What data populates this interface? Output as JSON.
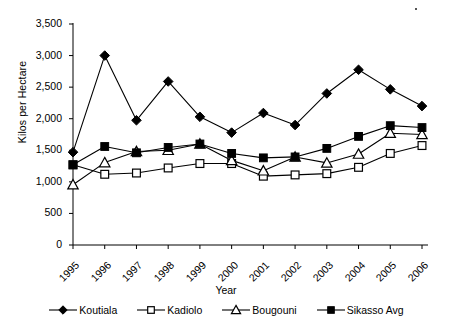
{
  "chart_data": {
    "type": "line",
    "title": "",
    "xlabel": "Year",
    "ylabel": "Kilos per Hectare",
    "categories": [
      "1995",
      "1996",
      "1997",
      "1998",
      "1999",
      "2000",
      "2001",
      "2002",
      "2003",
      "2004",
      "2005",
      "2006"
    ],
    "x": [
      1995,
      1996,
      1997,
      1998,
      1999,
      2000,
      2001,
      2002,
      2003,
      2004,
      2005,
      2006
    ],
    "ylim": [
      0,
      3500
    ],
    "yticks": [
      0,
      500,
      1000,
      1500,
      2000,
      2500,
      3000,
      3500
    ],
    "ytick_labels": [
      "0",
      "500",
      "1,000",
      "1,500",
      "2,000",
      "2,500",
      "3,000",
      "3,500"
    ],
    "grid": false,
    "legend_position": "bottom",
    "series": [
      {
        "name": "Koutiala",
        "marker": "filled-diamond",
        "values": [
          1470,
          3000,
          1975,
          2590,
          2030,
          1780,
          2090,
          1900,
          2400,
          2775,
          2465,
          2200
        ]
      },
      {
        "name": "Kadiolo",
        "marker": "open-square",
        "values": [
          1270,
          1120,
          1140,
          1220,
          1290,
          1290,
          1090,
          1110,
          1130,
          1230,
          1450,
          1575
        ]
      },
      {
        "name": "Bougouni",
        "marker": "open-triangle",
        "values": [
          955,
          1305,
          1480,
          1500,
          1600,
          1340,
          1175,
          1395,
          1300,
          1440,
          1770,
          1750
        ]
      },
      {
        "name": "Sikasso Avg",
        "marker": "filled-square",
        "values": [
          1270,
          1560,
          1460,
          1545,
          1600,
          1450,
          1380,
          1395,
          1530,
          1720,
          1890,
          1860
        ]
      }
    ]
  },
  "legend": {
    "items": [
      {
        "label": "Koutiala",
        "marker": "filled-diamond"
      },
      {
        "label": "Kadiolo",
        "marker": "open-square"
      },
      {
        "label": "Bougouni",
        "marker": "open-triangle"
      },
      {
        "label": "Sikasso Avg",
        "marker": "filled-square"
      }
    ]
  }
}
